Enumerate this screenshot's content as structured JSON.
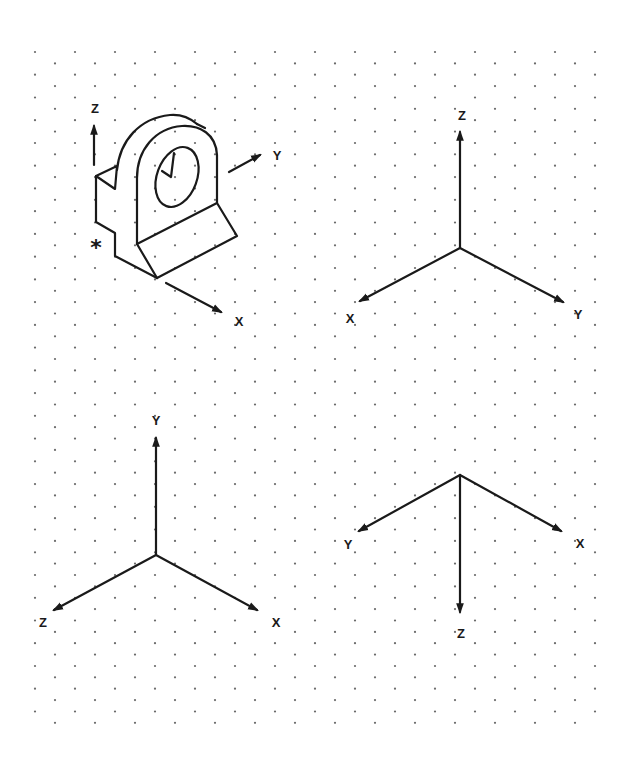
{
  "grid": {
    "type": "isometric-dot-grid",
    "x_start_even": 35,
    "x_start_odd": 55,
    "x_step": 40,
    "x_max": 605,
    "y_start": 52,
    "row_step": 11.37,
    "rows": 60,
    "dot_color": "#6a6a6a"
  },
  "figures": [
    {
      "id": "object-with-axes",
      "description": "Isometric bracket with hole and axis arrows",
      "axes": [
        {
          "name": "Z",
          "label": "Z",
          "from": [
            94,
            165
          ],
          "to": [
            94,
            125
          ],
          "label_pos": [
            95,
            110
          ]
        },
        {
          "name": "Y",
          "label": "Y",
          "from": [
            229,
            172
          ],
          "to": [
            261,
            154
          ],
          "label_pos": [
            277,
            157
          ]
        },
        {
          "name": "X",
          "label": "X",
          "from": [
            166,
            283
          ],
          "to": [
            222,
            313
          ],
          "label_pos": [
            239,
            323
          ]
        }
      ],
      "marker": {
        "label": "*",
        "pos": [
          95,
          246
        ]
      }
    },
    {
      "id": "axes-z-up",
      "axes": [
        {
          "name": "Z",
          "label": "Z",
          "from": [
            460,
            248
          ],
          "to": [
            460,
            131
          ],
          "label_pos": [
            462,
            117
          ]
        },
        {
          "name": "X",
          "label": "X",
          "from": [
            460,
            248
          ],
          "to": [
            359,
            302
          ],
          "label_pos": [
            350,
            320
          ]
        },
        {
          "name": "Y",
          "label": "Y",
          "from": [
            460,
            248
          ],
          "to": [
            564,
            303
          ],
          "label_pos": [
            578,
            316
          ]
        }
      ]
    },
    {
      "id": "axes-y-up",
      "axes": [
        {
          "name": "Y",
          "label": "Y",
          "from": [
            156,
            555
          ],
          "to": [
            156,
            437
          ],
          "label_pos": [
            156,
            422
          ]
        },
        {
          "name": "Z",
          "label": "Z",
          "from": [
            156,
            555
          ],
          "to": [
            53,
            611
          ],
          "label_pos": [
            43,
            624
          ]
        },
        {
          "name": "X",
          "label": "X",
          "from": [
            156,
            555
          ],
          "to": [
            258,
            611
          ],
          "label_pos": [
            276,
            624
          ]
        }
      ]
    },
    {
      "id": "axes-z-down",
      "axes": [
        {
          "name": "Z",
          "label": "Z",
          "from": [
            460,
            475
          ],
          "to": [
            460,
            613
          ],
          "label_pos": [
            461,
            635
          ]
        },
        {
          "name": "Y",
          "label": "Y",
          "from": [
            460,
            475
          ],
          "to": [
            358,
            532
          ],
          "label_pos": [
            348,
            546
          ]
        },
        {
          "name": "X",
          "label": "X",
          "from": [
            460,
            475
          ],
          "to": [
            562,
            532
          ],
          "label_pos": [
            580,
            545
          ]
        }
      ]
    }
  ]
}
